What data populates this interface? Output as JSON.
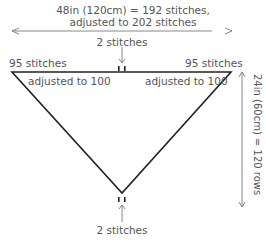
{
  "width_label": {
    "line1": "48in (120cm) = 192 stitches,",
    "line2": "adjusted to 202 stitches"
  },
  "top_center_label": "2 stitches",
  "left_label": "95 stitches",
  "right_label": "95 stitches",
  "left_adjusted": "adjusted to 100",
  "right_adjusted": "adjusted to 100",
  "bottom_label": "2 stitches",
  "height_label": "24in (60cm) = 120 rows",
  "colors": {
    "outline": "#222222",
    "arrow": "#888888",
    "text": "#555555"
  }
}
